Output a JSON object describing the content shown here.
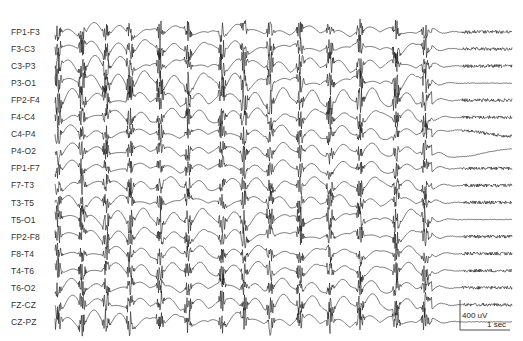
{
  "figure": {
    "type": "eeg-recording",
    "montage": "bipolar longitudinal",
    "channels": [
      {
        "label": "FP1-F3"
      },
      {
        "label": "F3-C3"
      },
      {
        "label": "C3-P3"
      },
      {
        "label": "P3-O1"
      },
      {
        "label": "FP2-F4"
      },
      {
        "label": "F4-C4"
      },
      {
        "label": "C4-P4"
      },
      {
        "label": "P4-O2"
      },
      {
        "label": "FP1-F7"
      },
      {
        "label": "F7-T3"
      },
      {
        "label": "T3-T5"
      },
      {
        "label": "T5-O1"
      },
      {
        "label": "FP2-F8"
      },
      {
        "label": "F8-T4"
      },
      {
        "label": "T4-T6"
      },
      {
        "label": "T6-O2"
      },
      {
        "label": "FZ-CZ"
      },
      {
        "label": "CZ-PZ"
      }
    ],
    "layout": {
      "first_channel_y": 32,
      "channel_spacing": 17.05,
      "trace_start_x": 55,
      "ictal_end_x": 432,
      "trace_end_x": 512
    },
    "burst_x_positions": [
      58,
      82,
      106,
      130,
      160,
      188,
      222,
      244,
      270,
      300,
      330,
      360,
      396,
      425
    ],
    "post_ictal_fast_channels": [
      0,
      1,
      2,
      4,
      5,
      6,
      8,
      9,
      10,
      12,
      13,
      14,
      15,
      16
    ],
    "calibration": {
      "amplitude_label": "400 uV",
      "time_label": "1 sec",
      "x": 460,
      "y_top": 300,
      "y_bottom": 330,
      "x_right": 510
    },
    "colors": {
      "trace": "#1a1a1a",
      "label": "#333333",
      "background": "#ffffff"
    }
  }
}
